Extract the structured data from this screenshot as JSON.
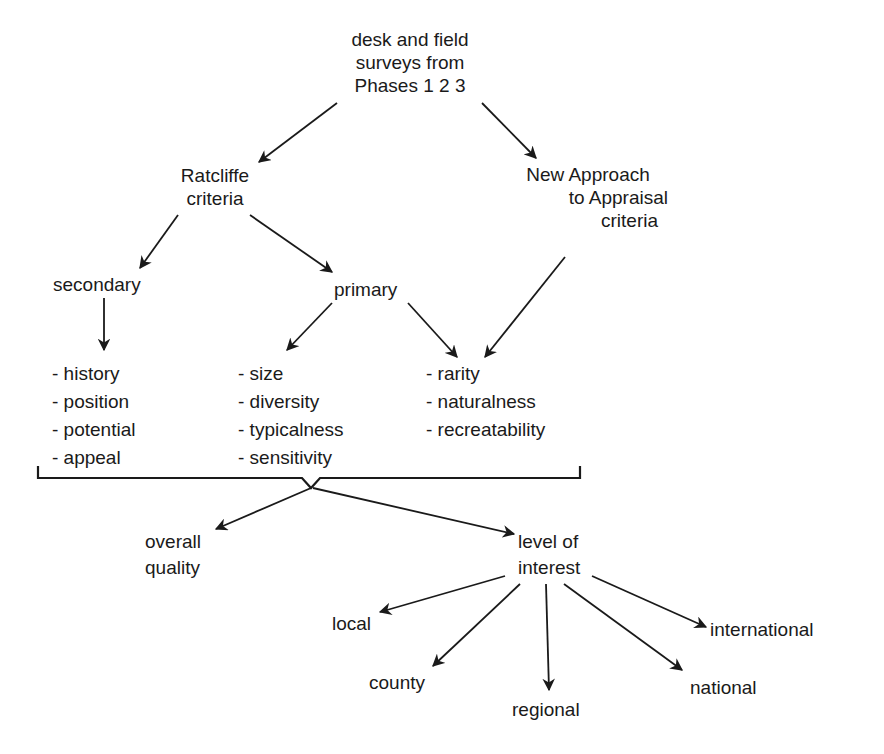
{
  "diagram": {
    "root": {
      "lines": [
        "desk and field",
        "surveys from",
        "Phases 1 2 3"
      ]
    },
    "ratcliffe": {
      "lines": [
        "Ratcliffe",
        "criteria"
      ]
    },
    "new_approach": {
      "lines": [
        "New Approach",
        "to Appraisal",
        "criteria"
      ]
    },
    "secondary": {
      "label": "secondary"
    },
    "primary": {
      "label": "primary"
    },
    "secondary_items": [
      "- history",
      "- position",
      "- potential",
      "- appeal"
    ],
    "primary_items": [
      "- size",
      "- diversity",
      "- typicalness",
      "- sensitivity"
    ],
    "shared_items": [
      "- rarity",
      "- naturalness",
      "- recreatability"
    ],
    "overall_quality": {
      "lines": [
        "overall",
        "quality"
      ]
    },
    "level_of_interest": {
      "lines": [
        "level of",
        "interest"
      ]
    },
    "levels": {
      "local": "local",
      "county": "county",
      "regional": "regional",
      "national": "national",
      "international": "international"
    },
    "colors": {
      "ink": "#1a1a1a",
      "background": "#ffffff"
    }
  }
}
